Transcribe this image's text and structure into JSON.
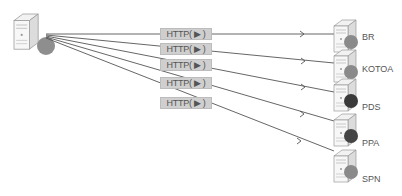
{
  "source": {
    "name": "client-server"
  },
  "connections": [
    {
      "label": "HTTP( ▶ )",
      "target": "BR",
      "dot_color": "#8a8a8a"
    },
    {
      "label": "HTTP( ▶ )",
      "target": "KOTOA",
      "dot_color": "#8a8a8a"
    },
    {
      "label": "HTTP( ▶ )",
      "target": "PDS",
      "dot_color": "#3a3a3a"
    },
    {
      "label": "HTTP( ▶ )",
      "target": "PPA",
      "dot_color": "#444444"
    },
    {
      "label": "HTTP( ▶ )",
      "target": "SPN",
      "dot_color": "#8a8a8a"
    }
  ]
}
